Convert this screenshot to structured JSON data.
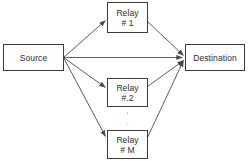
{
  "diagram": {
    "background_color": "#ffffff",
    "line_color": "#4a4a4a",
    "box_border_color": "#3b3b3b",
    "text_color": "#2b2b2b",
    "dot_color": "#b9b9b9",
    "nodes": {
      "source": {
        "label": "Source"
      },
      "destination": {
        "label": "Destination"
      },
      "relay1": {
        "label_line1": "Relay",
        "label_line2": "# 1"
      },
      "relay2": {
        "label_line1": "Relay",
        "label_line2": "#.2"
      },
      "relayM": {
        "label_line1": "Relay",
        "label_line2": "# M"
      }
    },
    "ellipsis": {
      "symbol": "vertical-dots",
      "count": 2
    },
    "edges": [
      {
        "from": "Source",
        "to": "Relay # 1"
      },
      {
        "from": "Source",
        "to": "Relay #.2"
      },
      {
        "from": "Source",
        "to": "Relay # M"
      },
      {
        "from": "Source",
        "to": "Destination"
      },
      {
        "from": "Relay # 1",
        "to": "Destination"
      },
      {
        "from": "Relay #.2",
        "to": "Destination"
      },
      {
        "from": "Relay # M",
        "to": "Destination"
      }
    ]
  }
}
